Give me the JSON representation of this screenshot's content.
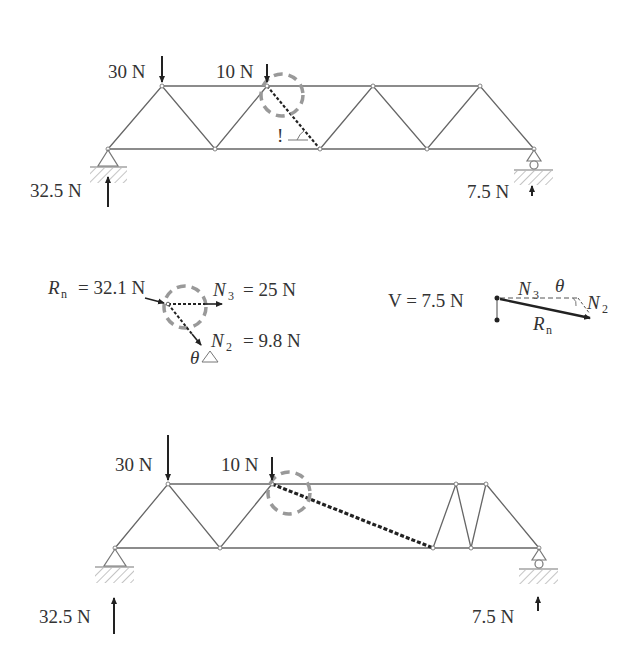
{
  "colors": {
    "member": "#555555",
    "text": "#333333",
    "highlight_circle": "#999999",
    "cut_member": "#222222",
    "ground_hatch": "#888888"
  },
  "diagram_top": {
    "name": "original-truss",
    "loads": [
      {
        "label": "30 N",
        "node_x": 162
      },
      {
        "label": "10 N",
        "node_x": 267
      }
    ],
    "reactions": [
      {
        "label": "32.5 N",
        "support": "pin-left"
      },
      {
        "label": "7.5 N",
        "support": "roller-right"
      }
    ],
    "marker_text": "!",
    "top_chord_y": 86,
    "bottom_chord_y": 149,
    "top_nodes_x": [
      162,
      267,
      373,
      480
    ],
    "bottom_nodes_x": [
      108,
      215,
      320,
      427,
      534
    ]
  },
  "free_body": {
    "rn_symbol": "R",
    "rn_sub": "n",
    "rn_value": "= 32.1 N",
    "n3_symbol": "N",
    "n3_sub": "3",
    "n3_value": "= 25 N",
    "n2_symbol": "N",
    "n2_sub": "2",
    "n2_value": "= 9.8 N",
    "theta": "θ"
  },
  "force_triangle": {
    "v_label": "V = 7.5 N",
    "n3_symbol": "N",
    "n3_sub": "3",
    "theta": "θ",
    "n2_symbol": "N",
    "n2_sub": "2",
    "rn_symbol": "R",
    "rn_sub": "n"
  },
  "diagram_bottom": {
    "name": "modified-truss",
    "loads": [
      {
        "label": "30 N",
        "node_x": 168
      },
      {
        "label": "10 N",
        "node_x": 272
      }
    ],
    "reactions": [
      {
        "label": "32.5 N",
        "support": "pin-left"
      },
      {
        "label": "7.5 N",
        "support": "roller-right"
      }
    ],
    "top_chord_y": 484,
    "bottom_chord_y": 548
  }
}
